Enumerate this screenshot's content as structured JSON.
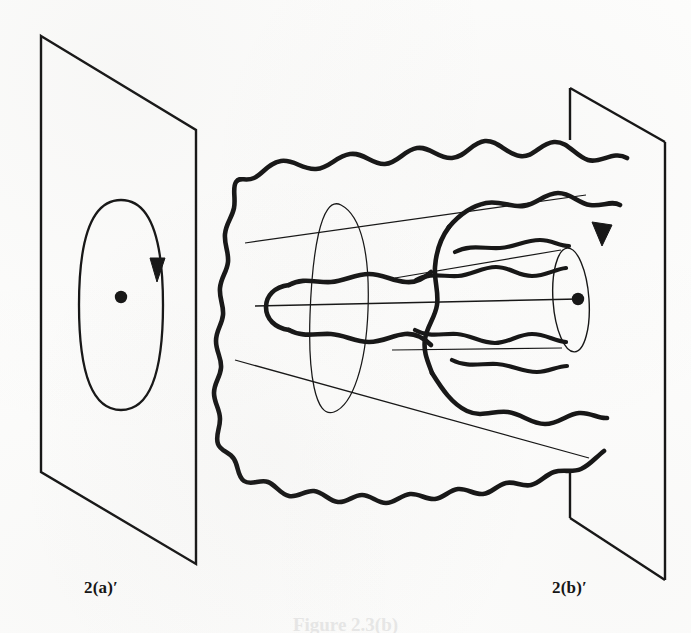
{
  "figure": {
    "kind": "line-drawing",
    "background_color": "#fdfdfc",
    "ink_color": "#141414",
    "width": 691,
    "height": 633
  },
  "labels": {
    "left_panel": "2(a)′",
    "right_panel": "2(b)′",
    "caption_cut_off": "Figure 2.3(b)"
  },
  "left_panel": {
    "plane": {
      "name": "left-plane",
      "corners": [
        [
          41,
          36
        ],
        [
          196,
          130
        ],
        [
          196,
          564
        ],
        [
          41,
          472
        ]
      ]
    },
    "loop": {
      "name": "oriented-loop",
      "shape": "ellipse",
      "center": [
        121,
        305
      ],
      "rx": 42,
      "ry": 105,
      "orientation": "clockwise"
    },
    "arrow": {
      "name": "loop-orientation-arrow",
      "position": [
        155,
        266
      ],
      "direction": "down"
    },
    "point": {
      "name": "base-point",
      "position": [
        121,
        297
      ],
      "radius": 6
    }
  },
  "right_panel": {
    "plane": {
      "name": "right-plane",
      "corners": [
        [
          570,
          88
        ],
        [
          665,
          142
        ],
        [
          624,
          535
        ],
        [
          570,
          518
        ]
      ]
    },
    "arrow": {
      "name": "tube-orientation-arrow",
      "position": [
        604,
        232
      ],
      "direction": "down-right"
    },
    "point": {
      "name": "base-point",
      "position": [
        578,
        299
      ],
      "radius": 6
    }
  },
  "middle": {
    "outer_blob": {
      "name": "outer-wavy-boundary",
      "stroke_width": 4.6,
      "style": "thick wavy closed-ish curve, open at right where it meets the right plane"
    },
    "inner_blob": {
      "name": "inner-wavy-boundary",
      "stroke_width": 4.6
    },
    "left_finger": {
      "name": "left-wavy-finger",
      "stroke_width": 4.6
    },
    "cone": {
      "name": "perspective-cone",
      "stroke_width": 1.2,
      "style": "thin-line truncated cone narrowing to the right with elliptical cross-sections",
      "left_ellipse": {
        "center": [
          339,
          309
        ],
        "rx": 28,
        "ry": 104
      },
      "right_ellipse": {
        "center": [
          571,
          300
        ],
        "rx": 17,
        "ry": 52
      }
    },
    "axis": {
      "name": "cone-axis-line",
      "from": [
        258,
        307
      ],
      "to": [
        578,
        299
      ]
    }
  },
  "colors": {
    "ink": "#141414",
    "paper": "#fdfdfc",
    "ghost_caption": "#cfcfcf"
  }
}
